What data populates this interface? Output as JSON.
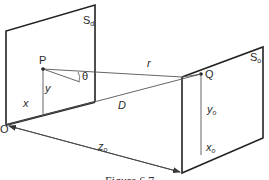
{
  "figure": {
    "caption": "Figure 6.7",
    "planes": {
      "display": {
        "label": "S",
        "subscript": "d"
      },
      "object": {
        "label": "S",
        "subscript": "o"
      }
    },
    "points": {
      "P": "P",
      "Q": "Q",
      "O": "O"
    },
    "labels": {
      "theta": "θ",
      "r": "r",
      "D": "D",
      "x": "x",
      "y": "y",
      "z0": {
        "base": "z",
        "subscript": "o"
      },
      "x0": {
        "base": "x",
        "subscript": "o"
      },
      "y0": {
        "base": "y",
        "subscript": "o"
      }
    }
  }
}
